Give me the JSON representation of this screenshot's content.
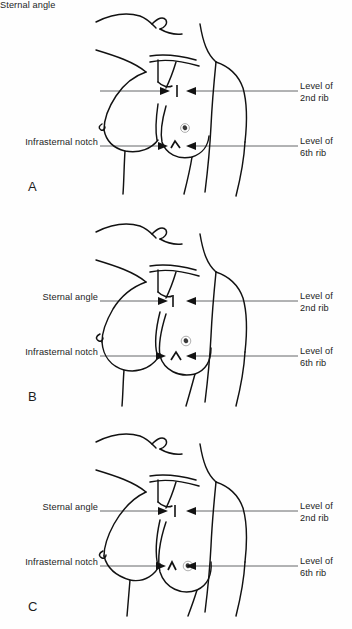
{
  "figure": {
    "background_color": "#fefefe",
    "ink_color": "#121212",
    "leader_line_color": "#55585a",
    "label_text_color": "#1d1d1d"
  },
  "labels": {
    "sternal_angle": "Sternal angle",
    "infrasternal_notch": "Infrasternal notch",
    "level_2nd_rib_line1": "Level of",
    "level_2nd_rib_line2": "2nd rib",
    "level_6th_rib_line1": "Level of",
    "level_6th_rib_line2": "6th rib"
  },
  "panels": [
    {
      "id": "A",
      "letter": "A",
      "description": "Small / nulliparous breast form",
      "labels": {
        "left_upper": "Sternal angle",
        "left_lower": "Infrasternal notch",
        "right_upper_line1": "Level of",
        "right_upper_line2": "2nd rib",
        "right_lower_line1": "Level of",
        "right_lower_line2": "6th rib"
      },
      "markers": {
        "sternal_angle_marker": "opposing-arrows-with-tick",
        "infrasternal_notch_marker": "opposing-arrows-with-v-notch"
      }
    },
    {
      "id": "B",
      "letter": "B",
      "description": "Full / rounded breast form",
      "labels": {
        "left_upper": "Sternal angle",
        "left_lower": "Infrasternal notch",
        "right_upper_line1": "Level of",
        "right_upper_line2": "2nd rib",
        "right_lower_line1": "Level of",
        "right_lower_line2": "6th rib"
      },
      "markers": {
        "sternal_angle_marker": "opposing-arrows-with-tick",
        "infrasternal_notch_marker": "opposing-arrows-with-v-notch"
      }
    },
    {
      "id": "C",
      "letter": "C",
      "description": "Pendulous / ptotic breast form",
      "labels": {
        "left_upper": "Sternal angle",
        "left_lower": "Infrasternal notch",
        "right_upper_line1": "Level of",
        "right_upper_line2": "2nd rib",
        "right_lower_line1": "Level of",
        "right_lower_line2": "6th rib"
      },
      "markers": {
        "sternal_angle_marker": "opposing-arrows-with-tick",
        "infrasternal_notch_marker": "opposing-arrows-with-v-notch"
      }
    }
  ]
}
